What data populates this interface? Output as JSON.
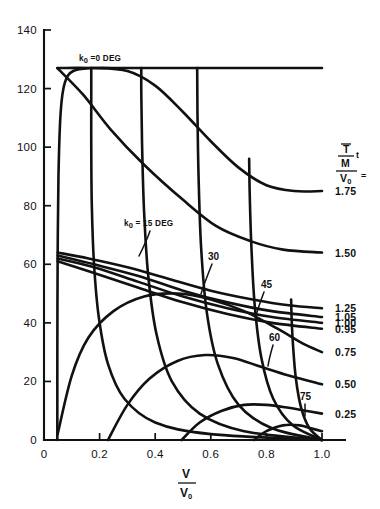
{
  "chart_data": {
    "type": "line",
    "title": "",
    "xlabel": "V/V0",
    "xlabel_num": "V",
    "xlabel_den": "V",
    "xlabel_den_sub": "0",
    "ylabel": "",
    "xlim": [
      0,
      1.0
    ],
    "ylim": [
      0,
      140
    ],
    "grid": false,
    "legend_position": "right-of-plot",
    "xticks": [
      "0",
      "0.2",
      "0.4",
      "0.6",
      "0.8",
      "1.0"
    ],
    "xtick_values": [
      0,
      0.2,
      0.4,
      0.6,
      0.8,
      1.0
    ],
    "yticks": [
      "0",
      "20",
      "40",
      "60",
      "80",
      "100",
      "120",
      "140"
    ],
    "ytick_values": [
      0,
      20,
      40,
      60,
      80,
      100,
      120,
      140
    ],
    "legend_formula": {
      "numerator_top": "T",
      "numerator_top_overbar": true,
      "numerator_bottom": "M",
      "numerator_suffix": "t",
      "denominator": "V",
      "denominator_sub": "0",
      "equals": "="
    },
    "series": [
      {
        "name": "k0 = 0 DEG",
        "family": "k0",
        "label": "k₀ = 0 DEG",
        "value": 0,
        "units": "DEG",
        "annotation_text": "=0 DEG",
        "annotation_symbol": "k",
        "annotation_sub": "0",
        "points": [
          [
            0.048,
            0
          ],
          [
            0.048,
            30
          ],
          [
            0.049,
            60
          ],
          [
            0.052,
            90
          ],
          [
            0.06,
            112
          ],
          [
            0.075,
            122
          ],
          [
            0.105,
            126
          ],
          [
            0.17,
            127
          ],
          [
            0.3,
            127
          ],
          [
            0.5,
            127
          ],
          [
            0.7,
            127
          ],
          [
            0.86,
            127
          ],
          [
            1.0,
            127
          ]
        ]
      },
      {
        "name": "k0 = 15 DEG",
        "family": "k0",
        "label": "k₀ = 15 DEG",
        "value": 15,
        "units": "DEG",
        "annotation_text": "= 15 DEG",
        "annotation_symbol": "k",
        "annotation_sub": "0",
        "points": [
          [
            1.0,
            0
          ],
          [
            0.6,
            2
          ],
          [
            0.4,
            6
          ],
          [
            0.29,
            14
          ],
          [
            0.23,
            26
          ],
          [
            0.197,
            42
          ],
          [
            0.18,
            60
          ],
          [
            0.172,
            80
          ],
          [
            0.17,
            100
          ],
          [
            0.17,
            118
          ],
          [
            0.17,
            127
          ]
        ]
      },
      {
        "name": "30",
        "family": "k0",
        "label": "30",
        "value": 30,
        "units": "DEG",
        "points": [
          [
            1.0,
            0
          ],
          [
            0.72,
            3
          ],
          [
            0.56,
            9
          ],
          [
            0.46,
            20
          ],
          [
            0.405,
            36
          ],
          [
            0.375,
            56
          ],
          [
            0.36,
            78
          ],
          [
            0.353,
            100
          ],
          [
            0.35,
            118
          ],
          [
            0.35,
            127
          ]
        ]
      },
      {
        "name": "45",
        "family": "k0",
        "label": "45",
        "value": 45,
        "units": "DEG",
        "points": [
          [
            1.0,
            0
          ],
          [
            0.82,
            4
          ],
          [
            0.7,
            12
          ],
          [
            0.625,
            26
          ],
          [
            0.585,
            44
          ],
          [
            0.565,
            66
          ],
          [
            0.556,
            90
          ],
          [
            0.552,
            112
          ],
          [
            0.551,
            127
          ]
        ]
      },
      {
        "name": "60",
        "family": "k0",
        "label": "60",
        "value": 60,
        "units": "DEG",
        "points": [
          [
            1.0,
            0
          ],
          [
            0.895,
            5
          ],
          [
            0.825,
            14
          ],
          [
            0.782,
            28
          ],
          [
            0.758,
            46
          ],
          [
            0.746,
            66
          ],
          [
            0.74,
            84
          ],
          [
            0.738,
            96
          ]
        ]
      },
      {
        "name": "75",
        "family": "k0",
        "label": "75",
        "value": 75,
        "units": "DEG",
        "points": [
          [
            1.0,
            0
          ],
          [
            0.955,
            4
          ],
          [
            0.925,
            11
          ],
          [
            0.906,
            21
          ],
          [
            0.896,
            32
          ],
          [
            0.891,
            41
          ],
          [
            0.889,
            48
          ]
        ]
      },
      {
        "name": "1.75",
        "family": "tm",
        "label": "1.75",
        "value": 1.75,
        "points": [
          [
            0.048,
            127
          ],
          [
            0.17,
            127
          ],
          [
            0.3,
            126
          ],
          [
            0.4,
            121
          ],
          [
            0.5,
            112
          ],
          [
            0.6,
            102
          ],
          [
            0.7,
            93
          ],
          [
            0.8,
            87
          ],
          [
            0.9,
            85
          ],
          [
            1.0,
            85
          ]
        ]
      },
      {
        "name": "1.50",
        "family": "tm",
        "label": "1.50",
        "value": 1.5,
        "points": [
          [
            0.048,
            127
          ],
          [
            0.14,
            118
          ],
          [
            0.24,
            106
          ],
          [
            0.36,
            94
          ],
          [
            0.5,
            82
          ],
          [
            0.62,
            73
          ],
          [
            0.74,
            68
          ],
          [
            0.86,
            65
          ],
          [
            1.0,
            64
          ]
        ]
      },
      {
        "name": "1.25",
        "family": "tm",
        "label": "1.25",
        "value": 1.25,
        "points": [
          [
            0.049,
            64
          ],
          [
            0.16,
            62
          ],
          [
            0.3,
            59
          ],
          [
            0.45,
            55
          ],
          [
            0.6,
            51
          ],
          [
            0.75,
            48
          ],
          [
            0.88,
            46
          ],
          [
            1.0,
            45
          ]
        ]
      },
      {
        "name": "1.05",
        "family": "tm",
        "label": "1.05",
        "points": [
          [
            0.049,
            63
          ],
          [
            0.18,
            60
          ],
          [
            0.34,
            56
          ],
          [
            0.5,
            51
          ],
          [
            0.66,
            47
          ],
          [
            0.82,
            44
          ],
          [
            1.0,
            42
          ]
        ]
      },
      {
        "name": "1.00",
        "family": "tm",
        "label": "1.00",
        "value": 1.0,
        "points": [
          [
            0.049,
            62
          ],
          [
            0.18,
            59
          ],
          [
            0.34,
            54
          ],
          [
            0.5,
            49
          ],
          [
            0.66,
            45
          ],
          [
            0.82,
            42
          ],
          [
            1.0,
            40
          ]
        ]
      },
      {
        "name": "0.95",
        "family": "tm",
        "label": "0.95",
        "value": 0.95,
        "points": [
          [
            0.049,
            61
          ],
          [
            0.18,
            57
          ],
          [
            0.34,
            52
          ],
          [
            0.5,
            47
          ],
          [
            0.66,
            43
          ],
          [
            0.82,
            40
          ],
          [
            1.0,
            38
          ]
        ]
      },
      {
        "name": "0.75",
        "family": "tm",
        "label": "0.75",
        "value": 0.75,
        "points": [
          [
            0.049,
            2
          ],
          [
            0.1,
            22
          ],
          [
            0.16,
            35
          ],
          [
            0.25,
            44
          ],
          [
            0.36,
            49
          ],
          [
            0.48,
            50
          ],
          [
            0.6,
            48
          ],
          [
            0.72,
            44
          ],
          [
            0.84,
            38
          ],
          [
            0.93,
            33
          ],
          [
            1.0,
            30
          ]
        ]
      },
      {
        "name": "0.50",
        "family": "tm",
        "label": "0.50",
        "value": 0.5,
        "points": [
          [
            0.23,
            0
          ],
          [
            0.3,
            12
          ],
          [
            0.38,
            21
          ],
          [
            0.48,
            27
          ],
          [
            0.58,
            29
          ],
          [
            0.68,
            28
          ],
          [
            0.78,
            25
          ],
          [
            0.88,
            22
          ],
          [
            1.0,
            19
          ]
        ]
      },
      {
        "name": "0.25",
        "family": "tm",
        "label": "0.25",
        "value": 0.25,
        "points": [
          [
            0.495,
            0
          ],
          [
            0.56,
            6
          ],
          [
            0.64,
            10
          ],
          [
            0.72,
            12
          ],
          [
            0.8,
            12
          ],
          [
            0.88,
            11
          ],
          [
            0.94,
            10
          ],
          [
            1.0,
            9
          ]
        ]
      },
      {
        "name": "0.10",
        "family": "tm",
        "label": "",
        "points": [
          [
            0.755,
            0
          ],
          [
            0.8,
            3
          ],
          [
            0.86,
            5
          ],
          [
            0.92,
            5
          ],
          [
            0.96,
            4
          ],
          [
            1.0,
            3
          ]
        ]
      }
    ],
    "right_labels": [
      "1.75",
      "1.50",
      "1.25",
      "1.05",
      "1.00",
      "0.95",
      "0.75",
      "0.50",
      "0.25"
    ],
    "interior_labels": [
      "k₀=0 DEG",
      "k₀ = 15 DEG",
      "30",
      "45",
      "60",
      "75"
    ]
  },
  "colors": {
    "ink": "#111111",
    "background": "#ffffff"
  }
}
